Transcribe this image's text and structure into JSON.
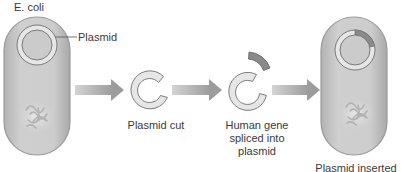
{
  "diagram": {
    "title_label": "E. coli",
    "plasmid_label": "Plasmid",
    "steps": [
      {
        "label": "Plasmid cut"
      },
      {
        "label_lines": [
          "Human gene",
          "spliced into",
          "plasmid"
        ]
      },
      {
        "label": "Plasmid inserted"
      }
    ],
    "colors": {
      "cell_fill": "#c9c9c9",
      "cell_edge": "#9a9a9a",
      "plasmid_ring": "#e6e6e6",
      "plasmid_outline": "#7a7a7a",
      "gene_segment": "#8a8a8a",
      "arrow": "#a8a8a8",
      "text": "#3a3a3a"
    }
  }
}
